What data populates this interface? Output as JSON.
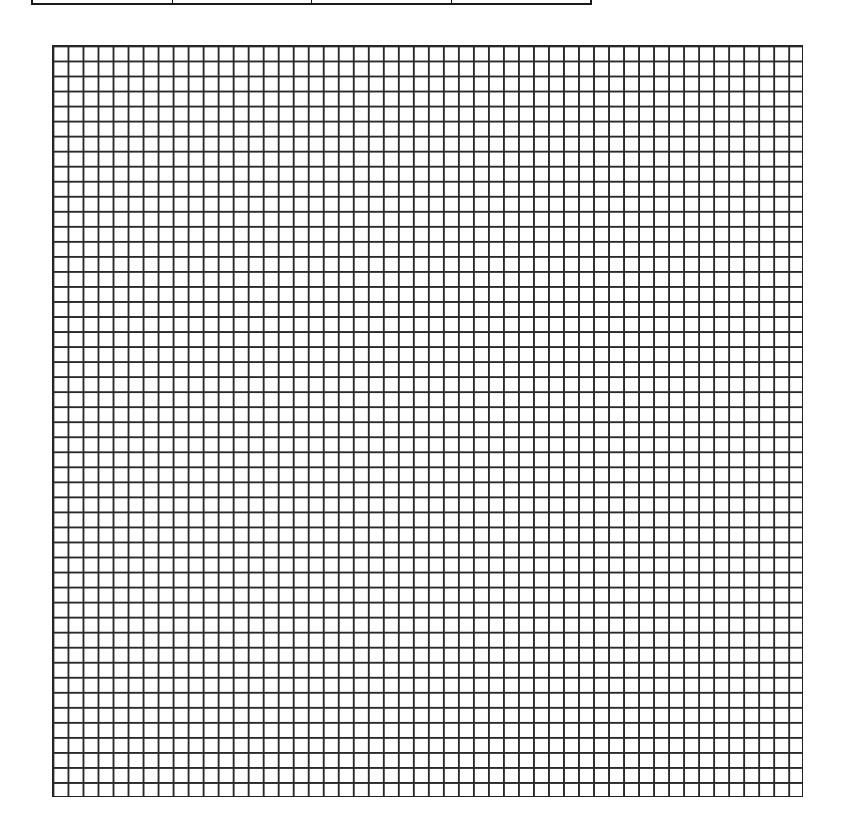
{
  "header_table": {
    "cells": [
      {
        "label": ""
      },
      {
        "label": ""
      },
      {
        "label": ""
      },
      {
        "label": ""
      }
    ]
  },
  "grid": {
    "columns": 50,
    "rows": 50,
    "cell_size_px": 15,
    "line_color": "#2a2a2a",
    "background": "#ffffff"
  }
}
